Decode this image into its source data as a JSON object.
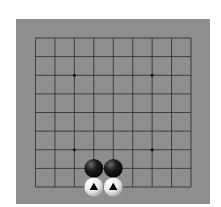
{
  "board": {
    "size": 9,
    "background_color": "#8e8e8e",
    "line_color": "#2a2a2a",
    "star_points": [
      [
        2,
        2
      ],
      [
        6,
        2
      ],
      [
        2,
        6
      ],
      [
        6,
        6
      ]
    ],
    "stones": [
      {
        "color": "black",
        "col": 3,
        "row": 7,
        "marker": null
      },
      {
        "color": "black",
        "col": 4,
        "row": 7,
        "marker": null
      },
      {
        "color": "white",
        "col": 3,
        "row": 8,
        "marker": "triangle"
      },
      {
        "color": "white",
        "col": 4,
        "row": 8,
        "marker": "triangle"
      }
    ]
  }
}
